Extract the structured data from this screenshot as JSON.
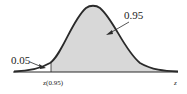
{
  "diagram": {
    "type": "normal-distribution-area",
    "colors": {
      "curve": "#2a2a2a",
      "shade": "#d8d8d8",
      "text": "#222222"
    },
    "labels": {
      "left_area": "0.05",
      "right_area": "0.95",
      "critical_value": "z(0.95)",
      "axis": "z"
    }
  }
}
